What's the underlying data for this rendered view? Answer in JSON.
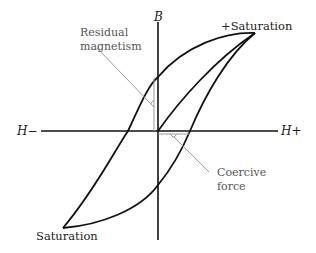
{
  "diagram": {
    "axes": {
      "vertical_label": "B",
      "horizontal_negative_label": "H−",
      "horizontal_positive_label": "H+"
    },
    "points": {
      "positive_saturation": "+Saturation",
      "negative_saturation": "Saturation"
    },
    "annotations": {
      "residual_line1": "Residual",
      "residual_line2": "magnetism",
      "coercive_line1": "Coercive",
      "coercive_line2": "force"
    },
    "colors": {
      "curve": "#111111",
      "annotation_line": "#999999",
      "text": "#333333"
    }
  }
}
